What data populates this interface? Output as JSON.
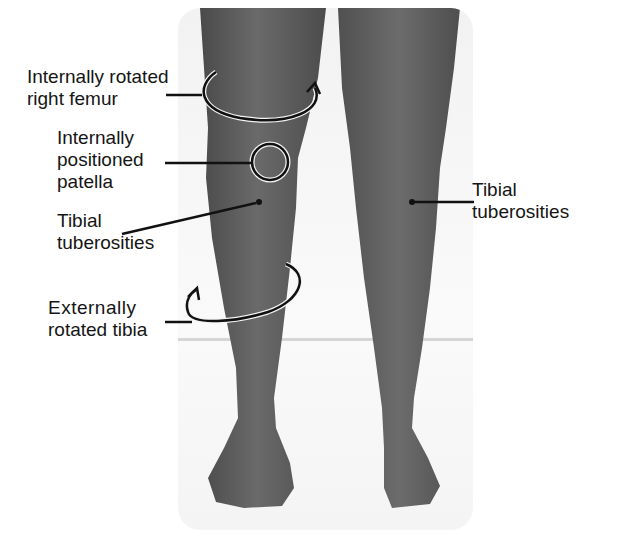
{
  "figure": {
    "colors": {
      "skin": "#5c5c5c",
      "background": "#ffffff",
      "panel": "#f4f4f4",
      "annotation": "#111111"
    }
  },
  "labels": {
    "femur": {
      "line1": "Internally rotated",
      "line2": "right femur"
    },
    "patella": {
      "line1": "Internally",
      "line2": "positioned",
      "line3": "patella"
    },
    "tibial_left": {
      "line1": "Tibial",
      "line2": "tuberosities"
    },
    "tibia": {
      "line1": "Externally",
      "line2": "rotated tibia"
    },
    "tibial_right": {
      "line1": "Tibial",
      "line2": "tuberosities"
    }
  }
}
